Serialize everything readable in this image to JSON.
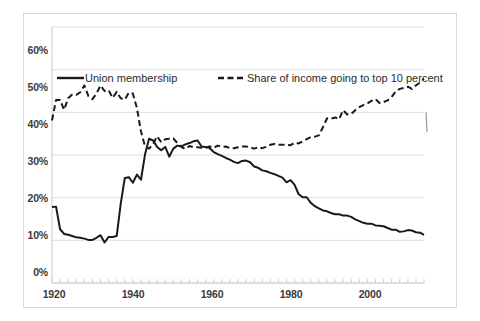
{
  "chart_data": {
    "type": "line",
    "title": "",
    "subtitle": "",
    "xlabel": "",
    "ylabel": "",
    "xlim": [
      1920,
      2012
    ],
    "ylim": [
      0,
      60
    ],
    "yticks": [
      0,
      10,
      20,
      30,
      40,
      50,
      60
    ],
    "ytick_labels": [
      "0%",
      "10%",
      "20%",
      "30%",
      "40%",
      "50%",
      "60%"
    ],
    "xticks": [
      1920,
      1940,
      1960,
      1980,
      2000
    ],
    "xtick_labels": [
      "1920",
      "1940",
      "1960",
      "1980",
      "2000"
    ],
    "x_minor_tick_interval": 2,
    "grid": "horizontal",
    "legend_position": "top-inside",
    "units": "percent",
    "series": [
      {
        "name": "Union membership",
        "style": "solid",
        "color": "#1a1a1a",
        "x": [
          1920,
          1921,
          1922,
          1923,
          1924,
          1925,
          1926,
          1927,
          1928,
          1929,
          1930,
          1931,
          1932,
          1933,
          1934,
          1935,
          1936,
          1937,
          1938,
          1939,
          1940,
          1941,
          1942,
          1943,
          1944,
          1945,
          1946,
          1947,
          1948,
          1949,
          1950,
          1951,
          1952,
          1953,
          1954,
          1955,
          1956,
          1957,
          1958,
          1959,
          1960,
          1961,
          1962,
          1963,
          1964,
          1965,
          1966,
          1967,
          1968,
          1969,
          1970,
          1971,
          1972,
          1973,
          1974,
          1975,
          1976,
          1977,
          1978,
          1979,
          1980,
          1981,
          1982,
          1983,
          1984,
          1985,
          1986,
          1987,
          1988,
          1989,
          1990,
          1991,
          1992,
          1993,
          1994,
          1995,
          1996,
          1997,
          1998,
          1999,
          2000,
          2001,
          2002,
          2003,
          2004,
          2005,
          2006,
          2007,
          2008,
          2009,
          2010,
          2011,
          2012
        ],
        "values": [
          17.8,
          17.9,
          12.6,
          11.5,
          11.3,
          11.0,
          10.7,
          10.6,
          10.4,
          10.1,
          10.1,
          10.6,
          11.2,
          9.5,
          10.8,
          10.8,
          11.0,
          18.6,
          24.6,
          24.8,
          23.5,
          25.4,
          24.2,
          30.1,
          33.8,
          33.4,
          31.9,
          31.1,
          31.9,
          29.6,
          31.5,
          32.2,
          32.0,
          32.5,
          32.8,
          33.2,
          33.4,
          32.0,
          31.9,
          31.6,
          30.7,
          30.2,
          29.8,
          29.3,
          28.9,
          28.4,
          28.1,
          28.6,
          28.7,
          28.3,
          27.3,
          27.0,
          26.4,
          26.2,
          25.8,
          25.5,
          25.1,
          24.7,
          23.6,
          24.1,
          23.0,
          20.8,
          20.1,
          20.1,
          18.8,
          18.0,
          17.5,
          17.0,
          16.8,
          16.4,
          16.1,
          16.1,
          15.8,
          15.8,
          15.5,
          14.9,
          14.5,
          14.1,
          13.9,
          13.9,
          13.5,
          13.4,
          13.3,
          12.9,
          12.5,
          12.5,
          12.0,
          12.1,
          12.4,
          12.3,
          11.9,
          11.8,
          11.3
        ]
      },
      {
        "name": "Share of income going to top 10 percent",
        "style": "dashed",
        "color": "#1a1a1a",
        "x": [
          1920,
          1921,
          1922,
          1923,
          1924,
          1925,
          1926,
          1927,
          1928,
          1929,
          1930,
          1931,
          1932,
          1933,
          1934,
          1935,
          1936,
          1937,
          1938,
          1939,
          1940,
          1941,
          1942,
          1943,
          1944,
          1945,
          1946,
          1947,
          1948,
          1949,
          1950,
          1951,
          1952,
          1953,
          1954,
          1955,
          1956,
          1957,
          1958,
          1959,
          1960,
          1961,
          1962,
          1963,
          1964,
          1965,
          1966,
          1967,
          1968,
          1969,
          1970,
          1971,
          1972,
          1973,
          1974,
          1975,
          1976,
          1977,
          1978,
          1979,
          1980,
          1981,
          1982,
          1983,
          1984,
          1985,
          1986,
          1987,
          1988,
          1989,
          1990,
          1991,
          1992,
          1993,
          1994,
          1995,
          1996,
          1997,
          1998,
          1999,
          2000,
          2001,
          2002,
          2003,
          2004,
          2005,
          2006,
          2007,
          2008,
          2009,
          2010,
          2011,
          2012
        ],
        "values": [
          38.1,
          42.9,
          42.9,
          40.6,
          43.3,
          44.2,
          44.1,
          44.7,
          46.3,
          43.8,
          43.1,
          44.4,
          46.3,
          45.0,
          45.2,
          43.4,
          44.8,
          43.3,
          43.0,
          44.6,
          44.4,
          41.0,
          35.5,
          32.1,
          31.5,
          32.6,
          34.4,
          33.0,
          33.7,
          33.8,
          33.9,
          32.8,
          31.9,
          31.4,
          32.1,
          31.8,
          31.8,
          31.7,
          31.7,
          32.0,
          31.7,
          32.2,
          31.9,
          32.0,
          31.6,
          31.6,
          31.8,
          32.0,
          32.0,
          31.8,
          31.5,
          31.8,
          31.6,
          31.9,
          32.4,
          32.6,
          32.4,
          32.4,
          32.4,
          32.3,
          32.9,
          32.7,
          33.2,
          33.7,
          34.2,
          34.3,
          34.6,
          36.5,
          38.6,
          38.5,
          38.8,
          38.4,
          40.5,
          39.5,
          39.6,
          40.5,
          41.2,
          41.7,
          42.1,
          42.7,
          43.1,
          42.2,
          42.4,
          42.8,
          43.6,
          44.9,
          45.5,
          45.7,
          46.0,
          45.5,
          46.3,
          47.0,
          47.9
        ]
      }
    ],
    "annotations": []
  },
  "axes": {
    "y_labels": [
      "60%",
      "50%",
      "40%",
      "30%",
      "20%",
      "10%",
      "0%"
    ],
    "x_labels": [
      "1920",
      "1940",
      "1960",
      "1980",
      "2000"
    ]
  },
  "legend": {
    "items": [
      {
        "label": "Union membership",
        "style": "solid"
      },
      {
        "label": "Share of income going to top 10 percent",
        "style": "dashed"
      }
    ]
  },
  "colors": {
    "line": "#1a1a1a",
    "grid": "#e0e0e0",
    "axis": "#bdbdbd",
    "text": "#3b3b3b",
    "frame": "#d8d8d8",
    "background": "#ffffff"
  }
}
